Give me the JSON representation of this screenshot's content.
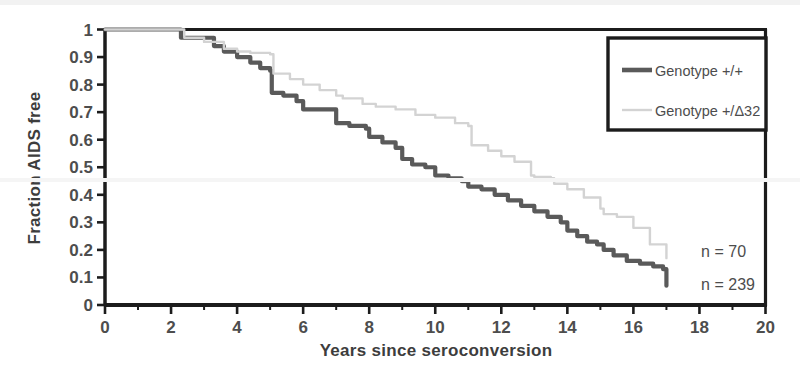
{
  "figure": {
    "background_color": "#ffffff",
    "plot_frame_color": "#1c1c1c"
  },
  "chart_data": {
    "type": "line",
    "title": "",
    "subtitle": "",
    "xlabel": "Years since seroconversion",
    "ylabel": "Fraction AIDS free",
    "xlim": [
      0,
      20
    ],
    "ylim": [
      0,
      1
    ],
    "xticks": [
      0,
      2,
      4,
      6,
      8,
      10,
      12,
      14,
      16,
      18,
      20
    ],
    "xticklabels": [
      "0",
      "2",
      "4",
      "6",
      "8",
      "10",
      "12",
      "14",
      "16",
      "18",
      "20"
    ],
    "yticks": [
      0,
      0.1,
      0.2,
      0.3,
      0.4,
      0.5,
      0.6,
      0.7,
      0.8,
      0.9,
      1
    ],
    "yticklabels": [
      "0",
      "0.1",
      "0.2",
      "0.3",
      "0.4",
      "0.5",
      "0.6",
      "0.7",
      "0.8",
      "0.9",
      "1"
    ],
    "grid": false,
    "legend_position": "top-right",
    "step_style": "post",
    "series": [
      {
        "name": "Genotype +/+",
        "color": "#5a5a5a",
        "linewidth": 4.2,
        "sample_size_label": "n = 239",
        "x": [
          0.0,
          2.0,
          2.3,
          3.0,
          3.3,
          3.6,
          4.0,
          4.4,
          4.7,
          5.0,
          5.05,
          5.4,
          5.8,
          6.0,
          6.9,
          7.0,
          7.4,
          7.9,
          8.0,
          8.4,
          8.8,
          9.0,
          9.3,
          9.7,
          10.0,
          10.4,
          10.8,
          11.0,
          11.4,
          11.8,
          12.2,
          12.6,
          13.0,
          13.4,
          13.8,
          14.0,
          14.3,
          14.6,
          14.9,
          15.1,
          15.4,
          15.8,
          16.2,
          16.6,
          16.9,
          17.0
        ],
        "y": [
          1.0,
          1.0,
          0.97,
          0.97,
          0.94,
          0.92,
          0.9,
          0.88,
          0.86,
          0.85,
          0.77,
          0.76,
          0.74,
          0.71,
          0.71,
          0.66,
          0.65,
          0.64,
          0.61,
          0.59,
          0.57,
          0.53,
          0.51,
          0.5,
          0.47,
          0.46,
          0.45,
          0.43,
          0.42,
          0.4,
          0.38,
          0.36,
          0.34,
          0.32,
          0.3,
          0.27,
          0.25,
          0.23,
          0.22,
          0.2,
          0.18,
          0.16,
          0.15,
          0.14,
          0.13,
          0.07
        ]
      },
      {
        "name": "Genotype +/Δ32",
        "color": "#d3d3d3",
        "linewidth": 2.4,
        "sample_size_label": "n = 70",
        "x": [
          0.0,
          2.1,
          2.4,
          3.0,
          3.6,
          4.0,
          4.4,
          4.7,
          5.0,
          5.1,
          5.6,
          6.0,
          6.5,
          7.0,
          7.2,
          7.8,
          8.2,
          8.8,
          9.4,
          10.0,
          10.6,
          11.0,
          11.1,
          11.6,
          12.0,
          12.4,
          12.9,
          13.0,
          13.5,
          13.6,
          14.0,
          14.5,
          15.0,
          15.1,
          15.5,
          16.0,
          16.5,
          17.0
        ],
        "y": [
          1.0,
          1.0,
          0.97,
          0.955,
          0.93,
          0.92,
          0.915,
          0.915,
          0.91,
          0.84,
          0.82,
          0.8,
          0.78,
          0.76,
          0.75,
          0.73,
          0.72,
          0.71,
          0.69,
          0.68,
          0.66,
          0.65,
          0.58,
          0.56,
          0.54,
          0.52,
          0.47,
          0.465,
          0.46,
          0.44,
          0.42,
          0.39,
          0.35,
          0.33,
          0.32,
          0.28,
          0.22,
          0.17
        ]
      }
    ],
    "annotations": [
      {
        "text": "n = 70",
        "x": 18.05,
        "y": 0.195
      },
      {
        "text": "n = 239",
        "x": 18.05,
        "y": 0.075
      }
    ]
  },
  "legend": {
    "entries": [
      {
        "label": "Genotype +/+",
        "color": "#5a5a5a"
      },
      {
        "label": "Genotype +/Δ32",
        "color": "#d3d3d3"
      }
    ]
  }
}
